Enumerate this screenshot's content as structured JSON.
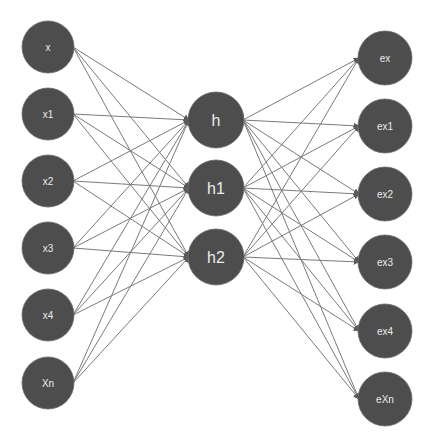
{
  "diagram": {
    "type": "neural-network",
    "colors": {
      "node_fill": "#4d4d4d",
      "node_text": "#ececec",
      "edge": "#7a7a7a",
      "background": "#ffffff"
    },
    "layers": [
      {
        "name": "input",
        "x": 48,
        "radius": 26,
        "label_size": "small",
        "nodes": [
          {
            "id": "x",
            "label": "x",
            "y": 47
          },
          {
            "id": "x1",
            "label": "x1",
            "y": 114
          },
          {
            "id": "x2",
            "label": "x2",
            "y": 181
          },
          {
            "id": "x3",
            "label": "x3",
            "y": 248
          },
          {
            "id": "x4",
            "label": "x4",
            "y": 315
          },
          {
            "id": "Xn",
            "label": "Xn",
            "y": 383
          }
        ]
      },
      {
        "name": "hidden",
        "x": 216,
        "radius": 28,
        "label_size": "large",
        "nodes": [
          {
            "id": "h",
            "label": "h",
            "y": 120
          },
          {
            "id": "h1",
            "label": "h1",
            "y": 188
          },
          {
            "id": "h2",
            "label": "h2",
            "y": 257
          }
        ]
      },
      {
        "name": "output",
        "x": 385,
        "radius": 27,
        "label_size": "small",
        "nodes": [
          {
            "id": "ex",
            "label": "ex",
            "y": 58
          },
          {
            "id": "ex1",
            "label": "ex1",
            "y": 126
          },
          {
            "id": "ex2",
            "label": "ex2",
            "y": 194
          },
          {
            "id": "ex3",
            "label": "ex3",
            "y": 262
          },
          {
            "id": "ex4",
            "label": "ex4",
            "y": 331
          },
          {
            "id": "eXn",
            "label": "eXn",
            "y": 399
          }
        ]
      }
    ],
    "connections": "fully-connected between consecutive layers, directed (arrowheads at target)"
  }
}
